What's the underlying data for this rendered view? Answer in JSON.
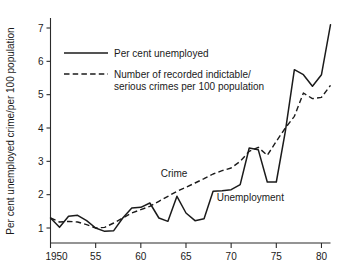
{
  "chart_data": {
    "type": "line",
    "title": "",
    "xlabel": "",
    "ylabel": "Per cent unemployed crime/per 100 population",
    "xlim": [
      1950,
      1981
    ],
    "ylim": [
      0.55,
      7.3
    ],
    "grid": false,
    "legend_position": "upper-left-inside",
    "xticks": [
      1950,
      1955,
      1960,
      1965,
      1970,
      1975,
      1980
    ],
    "xticklabels": [
      "1950",
      "55",
      "60",
      "65",
      "70",
      "75",
      "80"
    ],
    "yticks": [
      1,
      2,
      3,
      4,
      5,
      6,
      7
    ],
    "yticklabels": [
      "1",
      "2",
      "3",
      "4",
      "5",
      "6",
      "7"
    ],
    "x": [
      1950,
      1951,
      1952,
      1953,
      1954,
      1955,
      1956,
      1957,
      1958,
      1959,
      1960,
      1961,
      1962,
      1963,
      1964,
      1965,
      1966,
      1967,
      1968,
      1969,
      1970,
      1971,
      1972,
      1973,
      1974,
      1975,
      1976,
      1977,
      1978,
      1979,
      1980,
      1981
    ],
    "series": [
      {
        "name": "Per cent unemployed",
        "style": "solid",
        "inline_label": "Unemployment",
        "values": [
          1.3,
          1.02,
          1.35,
          1.38,
          1.22,
          1.0,
          0.9,
          0.92,
          1.3,
          1.6,
          1.62,
          1.75,
          1.3,
          1.2,
          1.95,
          1.45,
          1.22,
          1.28,
          2.1,
          2.12,
          2.15,
          2.3,
          3.4,
          3.35,
          2.38,
          2.38,
          3.9,
          5.75,
          5.6,
          5.25,
          5.6,
          7.1
        ]
      },
      {
        "name": "Number of recorded indictable/ serious crimes per 100 population",
        "style": "dashed",
        "inline_label": "Crime",
        "values": [
          1.3,
          1.18,
          1.2,
          1.18,
          1.1,
          1.0,
          1.02,
          1.15,
          1.3,
          1.45,
          1.55,
          1.65,
          1.8,
          1.95,
          2.1,
          2.22,
          2.35,
          2.48,
          2.62,
          2.72,
          2.8,
          3.0,
          3.3,
          3.42,
          3.18,
          3.6,
          4.0,
          4.35,
          5.05,
          4.88,
          4.92,
          5.28
        ]
      }
    ],
    "legend": [
      {
        "label": "Per cent unemployed",
        "style": "solid"
      },
      {
        "label": "Number of recorded indictable/",
        "style": "dashed"
      },
      {
        "label": "serious crimes per 100 population",
        "style": "continuation"
      }
    ],
    "annotations": [
      {
        "text": "Crime",
        "x": 1962.2,
        "y": 2.52
      },
      {
        "text": "Unemployment",
        "x": 1968.4,
        "y": 1.8
      }
    ]
  }
}
